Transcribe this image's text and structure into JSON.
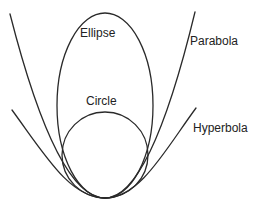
{
  "diagram": {
    "labels": {
      "ellipse": "Ellipse",
      "circle": "Circle",
      "parabola": "Parabola",
      "hyperbola": "Hyperbola"
    },
    "colors": {
      "stroke": "#2a2a2a",
      "background": "#ffffff",
      "text": "#222222"
    }
  }
}
